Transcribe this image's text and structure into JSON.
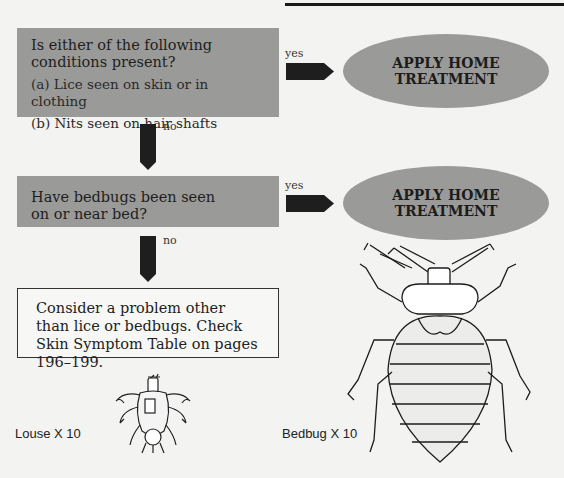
{
  "flowchart": {
    "question1": {
      "text": "Is either of the following conditions present?",
      "options": [
        "(a) Lice seen on skin or in clothing",
        "(b) Nits seen on hair shafts"
      ],
      "yes_label": "yes",
      "no_label": "no",
      "yes_outcome": "APPLY HOME TREATMENT"
    },
    "question2": {
      "text": "Have bedbugs been seen on or near bed?",
      "yes_label": "yes",
      "no_label": "no",
      "yes_outcome": "APPLY HOME TREATMENT"
    },
    "final": {
      "text": "Consider a problem other than lice or bedbugs. Check Skin Symptom Table on pages 196–199."
    }
  },
  "illustrations": {
    "louse": {
      "caption": "Louse   X 10",
      "icon": "louse-drawing"
    },
    "bedbug": {
      "caption": "Bedbug  X 10",
      "icon": "bedbug-drawing"
    }
  },
  "colors": {
    "box_gray": "#9a9a98",
    "arrow": "#1e1e1e",
    "background": "#f3f3f1"
  }
}
